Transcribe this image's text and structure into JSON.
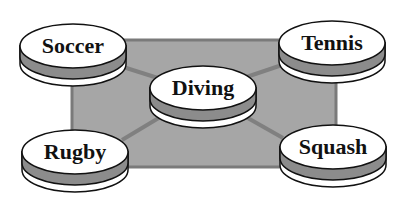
{
  "diagram": {
    "type": "hub-and-spoke",
    "colors": {
      "background": "#ffffff",
      "panel": "#a6a6a6",
      "panel_border": "#7a7a7a",
      "connector": "#808080",
      "disk_top": "#ffffff",
      "disk_band": "#8c8c8c",
      "disk_bottom": "#ffffff",
      "outline": "#111111"
    },
    "center": {
      "label": "Diving"
    },
    "nodes": [
      {
        "label": "Soccer",
        "position": "top-left"
      },
      {
        "label": "Tennis",
        "position": "top-right"
      },
      {
        "label": "Rugby",
        "position": "bottom-left"
      },
      {
        "label": "Squash",
        "position": "bottom-right"
      }
    ]
  }
}
